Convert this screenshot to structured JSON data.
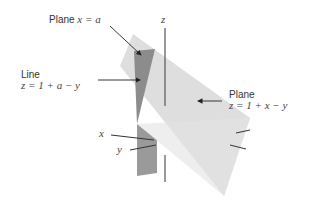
{
  "diagram": {
    "labels": {
      "plane_x_a": {
        "word": "Plane",
        "math": "x = a"
      },
      "line": {
        "word": "Line",
        "math": "z = 1 + a − y"
      },
      "plane_z": {
        "word": "Plane",
        "math": "z = 1 + x − y"
      },
      "axis_z": "z",
      "axis_x": "x",
      "axis_y": "y"
    },
    "colors": {
      "light_plane": "#dcdcdc",
      "dark_plane": "#8e8e8e",
      "axis": "#444444",
      "arrow": "#222222",
      "text": "#333333"
    }
  }
}
